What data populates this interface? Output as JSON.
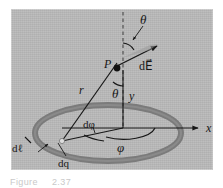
{
  "figure": {
    "domain": "Diagram",
    "panel_background": "#b9b9b9",
    "ring_color": "#7b7b7b",
    "line_color": "#171717",
    "caption_prefix": "Figure",
    "caption_number": "2.37",
    "caption_color": "#c9c9c9"
  },
  "labels": {
    "theta_top": "θ",
    "dE_field": "d",
    "dE_field_vector": "E⃗",
    "dE_field_full": "dE⃗",
    "point_p": "P",
    "radius_r": "r",
    "theta_mid": "θ",
    "axis_y": "y",
    "d_phi": "dφ",
    "phi": "φ",
    "axis_x": "x",
    "d_ell": "dℓ",
    "d_q": "dq"
  },
  "geometry": {
    "point_p": {
      "x": 116,
      "y": 68
    },
    "origin": {
      "x": 123,
      "y": 128
    },
    "charge_element": {
      "x": 62,
      "y": 141
    },
    "dashed_axis_top": {
      "x": 123,
      "y": 12
    },
    "x_axis_end": {
      "x": 200,
      "y": 128
    },
    "ring_center": {
      "x": 108,
      "y": 133
    },
    "ring_rx_outer": 76,
    "ring_ry_outer": 31,
    "ring_thickness": 6,
    "dE_arrow_tip": {
      "x": 160,
      "y": 44
    }
  },
  "elements": [
    {
      "name": "charged-ring",
      "type": "ellipse-annulus"
    },
    {
      "name": "dashed-vertical-axis",
      "type": "dashed-line"
    },
    {
      "name": "r-vector-line",
      "type": "line"
    },
    {
      "name": "y-axis-segment",
      "type": "line"
    },
    {
      "name": "x-axis-arrow",
      "type": "arrow"
    },
    {
      "name": "dE-field-arrow",
      "type": "arrow"
    },
    {
      "name": "theta-top-arc",
      "type": "arc"
    },
    {
      "name": "theta-mid-arc",
      "type": "arc"
    },
    {
      "name": "phi-arc",
      "type": "arc"
    },
    {
      "name": "dphi-arc",
      "type": "arc"
    },
    {
      "name": "radius-to-element-line",
      "type": "line"
    },
    {
      "name": "dq-leader-line",
      "type": "leader"
    },
    {
      "name": "dl-leader-line",
      "type": "leader"
    }
  ]
}
